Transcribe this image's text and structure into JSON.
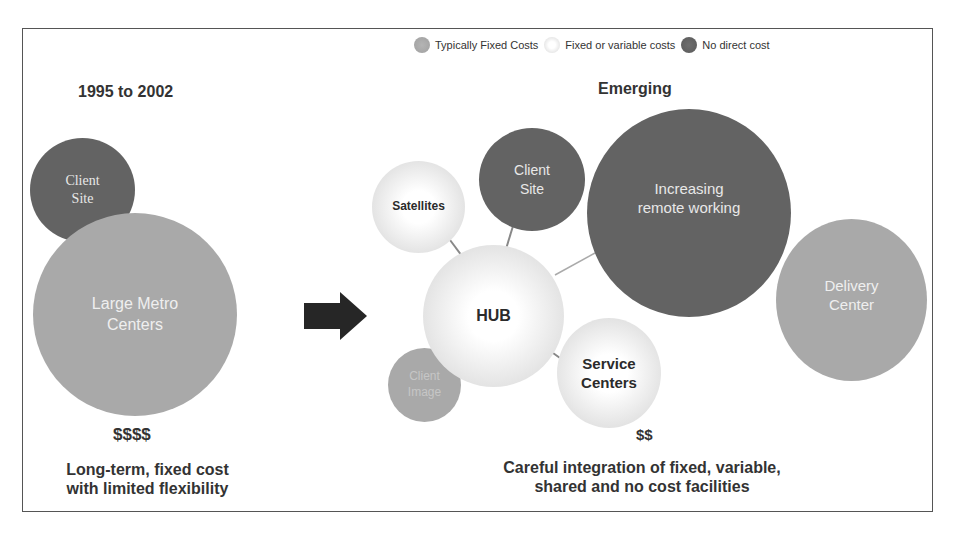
{
  "legend": [
    {
      "label": "Typically Fixed Costs",
      "type": "fixed",
      "color": "#a9a9a9"
    },
    {
      "label": "Fixed or variable costs",
      "type": "variable",
      "color": "#e4e4e4"
    },
    {
      "label": "No direct cost",
      "type": "none",
      "color": "#636363"
    }
  ],
  "left": {
    "title": "1995 to 2002",
    "nodes": {
      "client_site": {
        "line1": "Client",
        "line2": "Site",
        "cost_type": "none"
      },
      "large_metro": {
        "line1": "Large Metro",
        "line2": "Centers",
        "cost_type": "fixed"
      }
    },
    "cost": "$$$$",
    "caption_line1": "Long-term, fixed cost",
    "caption_line2": "with limited flexibility"
  },
  "transition_icon": "right-arrow-icon",
  "right": {
    "title": "Emerging",
    "nodes": {
      "satellites": {
        "label": "Satellites",
        "cost_type": "variable"
      },
      "client_site": {
        "line1": "Client",
        "line2": "Site",
        "cost_type": "none"
      },
      "remote": {
        "line1": "Increasing",
        "line2": "remote working",
        "cost_type": "none"
      },
      "delivery": {
        "line1": "Delivery",
        "line2": "Center",
        "cost_type": "fixed"
      },
      "hub": {
        "label": "HUB",
        "cost_type": "variable"
      },
      "client_image": {
        "line1": "Client",
        "line2": "Image",
        "cost_type": "fixed"
      },
      "service": {
        "line1": "Service",
        "line2": "Centers",
        "cost_type": "variable"
      }
    },
    "cost": "$$",
    "caption_line1": "Careful integration of fixed, variable,",
    "caption_line2": "shared and no cost facilities"
  }
}
